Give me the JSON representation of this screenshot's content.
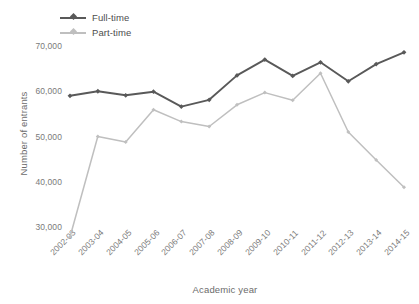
{
  "chart_data": {
    "type": "line",
    "title": "",
    "xlabel": "Academic year",
    "ylabel": "Number of entrants",
    "categories": [
      "2002-03",
      "2003-04",
      "2004-05",
      "2005-06",
      "2006-07",
      "2007-08",
      "2008-09",
      "2009-10",
      "2010-11",
      "2011-12",
      "2012-13",
      "2013-14",
      "2014-15"
    ],
    "series": [
      {
        "name": "Full-time",
        "color": "#595959",
        "marker": "diamond",
        "values": [
          59000,
          60000,
          59100,
          59900,
          56600,
          58100,
          63500,
          67000,
          63400,
          66400,
          62200,
          66000,
          68600
        ]
      },
      {
        "name": "Part-time",
        "color": "#bfbfbf",
        "marker": "diamond",
        "values": [
          27800,
          50000,
          48800,
          55900,
          53300,
          52200,
          57000,
          59700,
          58000,
          64000,
          51000,
          44800,
          38800
        ]
      }
    ],
    "ylim": [
      25000,
      72000
    ],
    "yticks": [
      30000,
      40000,
      50000,
      60000,
      70000
    ],
    "ytick_labels": [
      "30,000",
      "40,000",
      "50,000",
      "60,000",
      "70,000"
    ],
    "grid": false,
    "legend_position": "top-left",
    "legend_entries": [
      "Full-time",
      "Part-time"
    ]
  },
  "axes": {
    "y_title": "Number of entrants",
    "x_title": "Academic year"
  }
}
